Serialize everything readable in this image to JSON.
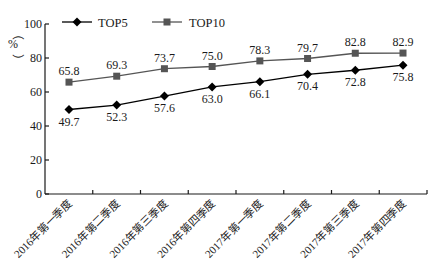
{
  "chart_data": {
    "type": "line",
    "title": "",
    "xlabel": "",
    "ylabel": "%",
    "ylim": [
      0,
      100
    ],
    "yticks": [
      0,
      20,
      40,
      60,
      80,
      100
    ],
    "grid": false,
    "legend_position": "top-left",
    "categories": [
      "2016年第一季度",
      "2016年第二季度",
      "2016年第三季度",
      "2016年第四季度",
      "2017年第一季度",
      "2017年第二季度",
      "2017年第三季度",
      "2017年第四季度"
    ],
    "series": [
      {
        "name": "TOP5",
        "marker": "diamond",
        "color": "#000000",
        "values": [
          49.7,
          52.3,
          57.6,
          63.0,
          66.1,
          70.4,
          72.8,
          75.8
        ],
        "labels": [
          "49.7",
          "52.3",
          "57.6",
          "63.0",
          "66.1",
          "70.4",
          "72.8",
          "75.8"
        ]
      },
      {
        "name": "TOP10",
        "marker": "square",
        "color": "#555555",
        "values": [
          65.8,
          69.3,
          73.7,
          75.0,
          78.3,
          79.7,
          82.8,
          82.9
        ],
        "labels": [
          "65.8",
          "69.3",
          "73.7",
          "75.0",
          "78.3",
          "79.7",
          "82.8",
          "82.9"
        ]
      }
    ]
  },
  "axis": {
    "unit_open": "（",
    "unit": "%",
    "unit_close": "）"
  },
  "legend": {
    "items": [
      {
        "label": "TOP5"
      },
      {
        "label": "TOP10"
      }
    ]
  }
}
